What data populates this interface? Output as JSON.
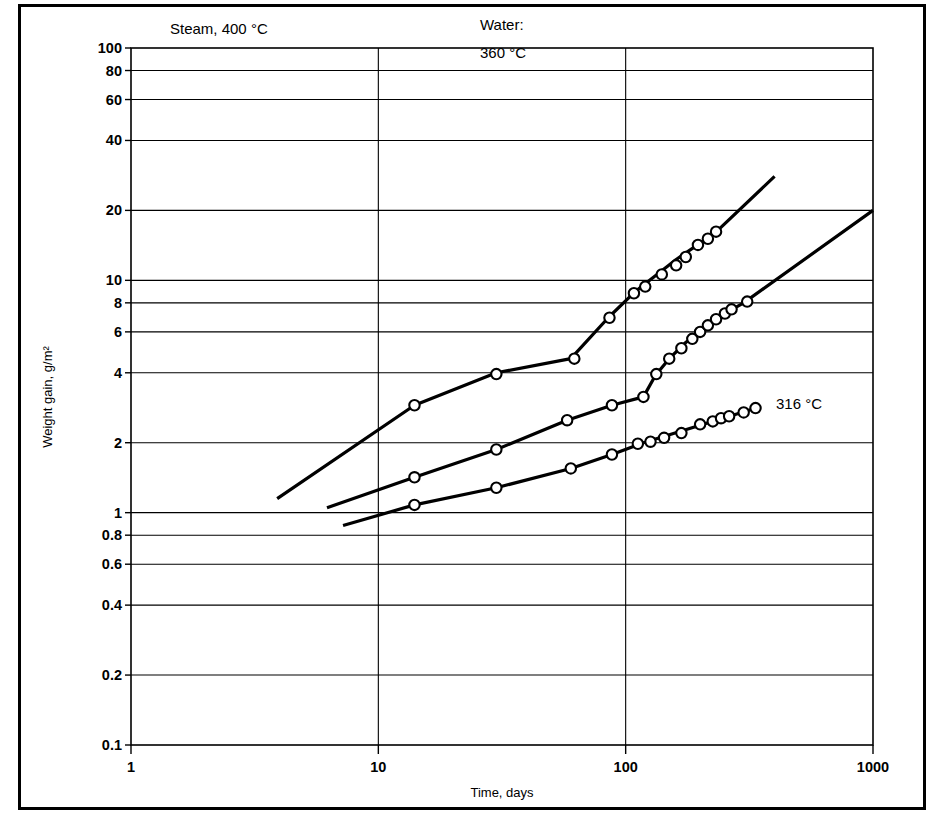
{
  "chart_data": {
    "type": "line",
    "title": "",
    "xlabel": "Time, days",
    "ylabel": "Weight gain, g/m2",
    "ylabel_display": "Weight gain, g/m²",
    "xscale": "log",
    "yscale": "log",
    "xlim": [
      1,
      1000
    ],
    "ylim": [
      0.1,
      100
    ],
    "grid": true,
    "legend_position": "inline-annotations",
    "x_ticks": [
      1,
      10,
      100,
      1000
    ],
    "x_tick_labels": [
      "1",
      "10",
      "100",
      "1000"
    ],
    "y_ticks": [
      0.1,
      0.2,
      0.4,
      0.6,
      0.8,
      1,
      2,
      4,
      6,
      8,
      10,
      20,
      40,
      60,
      80,
      100
    ],
    "y_tick_labels": [
      "0.1",
      "0.2",
      "0.4",
      "0.6",
      "0.8",
      "1",
      "2",
      "4",
      "6",
      "8",
      "10",
      "20",
      "40",
      "60",
      "80",
      "100"
    ],
    "series": [
      {
        "name": "Steam, 400 °C",
        "label": "Steam, 400 °C",
        "label_x": 170,
        "label_y": 34,
        "line": [
          [
            3.9,
            1.15
          ],
          [
            14,
            2.9
          ],
          [
            30,
            4.0
          ],
          [
            60,
            4.6
          ],
          [
            85,
            6.9
          ],
          [
            110,
            9.0
          ],
          [
            160,
            12.3
          ],
          [
            230,
            16.0
          ],
          [
            400,
            28.0
          ]
        ],
        "points": [
          [
            14,
            2.9
          ],
          [
            30,
            3.95
          ],
          [
            62,
            4.6
          ],
          [
            86,
            6.9
          ],
          [
            108,
            8.8
          ],
          [
            120,
            9.4
          ],
          [
            140,
            10.6
          ],
          [
            160,
            11.6
          ],
          [
            175,
            12.6
          ],
          [
            196,
            14.2
          ],
          [
            215,
            15.1
          ],
          [
            232,
            16.2
          ]
        ]
      },
      {
        "name": "Water: 360 °C",
        "label_line1": "Water:",
        "label_line2": "360 °C",
        "label_x": 480,
        "label_y": 30,
        "line": [
          [
            6.2,
            1.05
          ],
          [
            14,
            1.42
          ],
          [
            30,
            1.87
          ],
          [
            58,
            2.5
          ],
          [
            88,
            2.9
          ],
          [
            118,
            3.15
          ],
          [
            132,
            3.9
          ],
          [
            150,
            4.6
          ],
          [
            175,
            5.4
          ],
          [
            205,
            6.2
          ],
          [
            240,
            7.0
          ],
          [
            300,
            8.0
          ],
          [
            1000,
            20.0
          ]
        ],
        "points": [
          [
            14,
            1.42
          ],
          [
            30,
            1.87
          ],
          [
            58,
            2.5
          ],
          [
            88,
            2.9
          ],
          [
            118,
            3.15
          ],
          [
            133,
            3.95
          ],
          [
            150,
            4.6
          ],
          [
            168,
            5.1
          ],
          [
            186,
            5.6
          ],
          [
            200,
            6.0
          ],
          [
            215,
            6.4
          ],
          [
            232,
            6.8
          ],
          [
            252,
            7.2
          ],
          [
            268,
            7.5
          ],
          [
            310,
            8.1
          ]
        ]
      },
      {
        "name": "316 °C",
        "label": "316 °C",
        "label_x": 776,
        "label_y": 409,
        "line": [
          [
            7.2,
            0.88
          ],
          [
            14,
            1.08
          ],
          [
            30,
            1.28
          ],
          [
            60,
            1.55
          ],
          [
            88,
            1.78
          ],
          [
            118,
            2.0
          ],
          [
            200,
            2.38
          ],
          [
            330,
            2.8
          ]
        ],
        "points": [
          [
            14,
            1.08
          ],
          [
            30,
            1.28
          ],
          [
            60,
            1.55
          ],
          [
            88,
            1.78
          ],
          [
            112,
            1.98
          ],
          [
            126,
            2.02
          ],
          [
            143,
            2.1
          ],
          [
            168,
            2.2
          ],
          [
            200,
            2.4
          ],
          [
            225,
            2.47
          ],
          [
            243,
            2.55
          ],
          [
            262,
            2.6
          ],
          [
            300,
            2.7
          ],
          [
            335,
            2.82
          ]
        ]
      }
    ]
  }
}
